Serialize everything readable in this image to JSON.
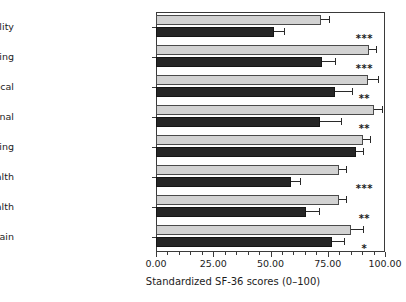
{
  "chart_data": {
    "type": "bar",
    "orientation": "horizontal",
    "title": "",
    "xlabel": "Standardized SF-36 scores (0–100)",
    "ylabel": "",
    "xlim": [
      0,
      100
    ],
    "xticks": [
      "0.00",
      "25.00",
      "50.00",
      "75.00",
      "100.00"
    ],
    "xtick_values": [
      0,
      25,
      50,
      75,
      100
    ],
    "grid": false,
    "legend": "none",
    "categories": [
      "Vitality",
      "Social functioning",
      "Role impairment, physical",
      "Role impairment, emotional",
      "Physical functioning",
      "Mental health",
      "General health",
      "Bodily pain"
    ],
    "series": [
      {
        "name": "light-gray-bar",
        "color": "#d2d2d2",
        "values": [
          72.0,
          93.0,
          92.5,
          95.0,
          90.5,
          80.0,
          80.0,
          85.0
        ],
        "errors": [
          3.5,
          3.0,
          4.5,
          3.5,
          3.0,
          3.0,
          3.0,
          5.5
        ]
      },
      {
        "name": "dark-bar",
        "color": "#262626",
        "values": [
          51.5,
          72.5,
          78.0,
          71.5,
          87.5,
          59.0,
          65.5,
          77.0
        ],
        "errors": [
          4.5,
          5.5,
          7.5,
          9.5,
          3.0,
          4.0,
          5.5,
          5.0
        ]
      }
    ],
    "significance": [
      "***",
      "***",
      "**",
      "**",
      "",
      "***",
      "**",
      "*"
    ]
  }
}
